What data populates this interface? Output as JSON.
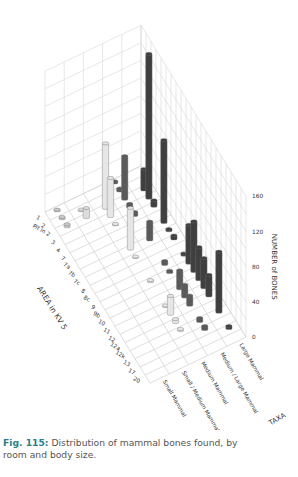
{
  "caption": {
    "fig_label": "Fig. 115:",
    "text": " Distribution of mammal bones found, by room and body size."
  },
  "colors": {
    "grid": "#d6d6d6",
    "floor_grid": "#d0d0d0",
    "caption_accent": "#2a7f86",
    "series": {
      "Small Mammal": "#c9c9c9",
      "Small / Medium Mammal": "#dcdcdc",
      "Medium Mammal": "#e6e6e6",
      "Medium / Large Mammal": "#5a5a5a",
      "Large Mammal": "#3f3f3f"
    }
  },
  "chart_data": {
    "type": "bar3d",
    "title": "",
    "xlabel": "AREA in KV 5",
    "ylabel": "TAXA",
    "zlabel": "NUMBER of BONES",
    "zlim": [
      0,
      160
    ],
    "z_ticks": [
      0,
      40,
      80,
      120,
      160
    ],
    "grid": true,
    "categories": [
      "1",
      "2",
      "Pit in 2",
      "3",
      "4",
      "7",
      "7a",
      "7b",
      "7c",
      "8",
      "8c",
      "9",
      "9b",
      "10",
      "11",
      "12",
      "12a",
      "12k",
      "13",
      "17",
      "20"
    ],
    "series": [
      {
        "name": "Small Mammal",
        "values": [
          2,
          3,
          4,
          0,
          0,
          0,
          0,
          0,
          0,
          0,
          0,
          0,
          0,
          0,
          0,
          0,
          0,
          0,
          0,
          0,
          0
        ]
      },
      {
        "name": "Small / Medium Mammal",
        "values": [
          0,
          1,
          12,
          0,
          0,
          0,
          0,
          0,
          0,
          0,
          0,
          0,
          0,
          0,
          0,
          0,
          0,
          0,
          0,
          0,
          0
        ]
      },
      {
        "name": "Medium Mammal",
        "values": [
          0,
          0,
          75,
          45,
          2,
          0,
          0,
          48,
          2,
          0,
          0,
          3,
          0,
          0,
          2,
          22,
          5,
          3,
          0,
          0,
          0
        ]
      },
      {
        "name": "Medium / Large Mammal",
        "values": [
          3,
          4,
          50,
          5,
          5,
          0,
          0,
          22,
          0,
          0,
          5,
          3,
          0,
          22,
          15,
          12,
          0,
          5,
          5,
          0,
          0
        ]
      },
      {
        "name": "Large Mammal",
        "values": [
          0,
          0,
          25,
          165,
          8,
          0,
          95,
          3,
          5,
          0,
          3,
          45,
          58,
          38,
          35,
          25,
          0,
          70,
          0,
          4,
          0
        ]
      }
    ],
    "taxa_labels": [
      "Small Mammal",
      "Small / Medium Mammal",
      "Medium Mammal",
      "Medium / Large Mammal",
      "Large Mammal"
    ]
  }
}
